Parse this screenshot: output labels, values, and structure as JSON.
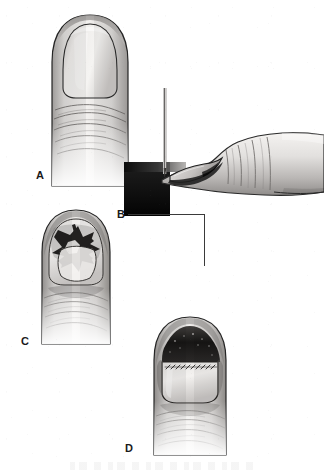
{
  "figure": {
    "width": 324,
    "height": 475,
    "background_color": "#ffffff",
    "ink_color": "#1a1a1a",
    "style": "grayscale pen-and-wash medical illustration",
    "panel_count": 4
  },
  "panels": [
    {
      "id": "A",
      "label": "A",
      "label_x": 36,
      "label_y": 170,
      "view": "dorsal",
      "subject": "thumb-distal-phalanx",
      "description": "Dorsal view of thumb with intact nail plate and subungual hematoma at base",
      "features": [
        "nail-plate",
        "lunula",
        "eponychium",
        "flexion-creases"
      ]
    },
    {
      "id": "B",
      "label": "B",
      "label_x": 117,
      "label_y": 210,
      "view": "lateral",
      "subject": "thumb-with-instrument",
      "description": "Lateral view of thumb resting on a surface with a trephination needle directed at the nail",
      "features": [
        "needle-instrument",
        "dark-support-block",
        "nail-plate-profile",
        "pulp"
      ]
    },
    {
      "id": "C",
      "label": "C",
      "label_x": 21,
      "label_y": 336,
      "view": "dorsal",
      "subject": "nail-removed-stellate-laceration",
      "description": "Nail plate removed exposing a stellate nail bed laceration",
      "features": [
        "stellate-laceration",
        "exposed-nail-bed",
        "nail-fold"
      ]
    },
    {
      "id": "D",
      "label": "D",
      "label_x": 125,
      "label_y": 443,
      "view": "dorsal",
      "subject": "repaired-nail-bed",
      "description": "Nail bed repaired with fine interrupted sutures and the nail plate replaced as a splint",
      "features": [
        "suture-line",
        "replaced-nail-plate",
        "proximal-hematoma"
      ]
    }
  ],
  "leaders": [
    {
      "id": "b-horizontal",
      "orientation": "horizontal",
      "x": 128,
      "y": 214,
      "length": 76
    },
    {
      "id": "b-vertical",
      "orientation": "vertical",
      "x": 204,
      "y": 214,
      "length": 52
    }
  ],
  "colors": {
    "outline": "#262626",
    "skin_light": "#f4f2f0",
    "skin_mid": "#c9c6c4",
    "skin_shadow": "#8d8a88",
    "nail_light": "#efedeb",
    "nail_mid": "#cfcccb",
    "hematoma": "#2b2b2b",
    "block_dark": "#1d1d1d",
    "suture": "#3a3a3a"
  }
}
